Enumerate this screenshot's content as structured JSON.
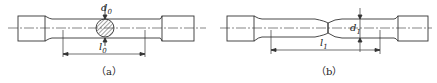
{
  "figures": [
    {
      "id": "a",
      "caption": "（a）",
      "diameter_label": "d",
      "diameter_sub": "0",
      "length_label": "l",
      "length_sub": "0"
    },
    {
      "id": "b",
      "caption": "（b）",
      "diameter_label": "d",
      "diameter_sub": "1",
      "length_label": "l",
      "length_sub": "1"
    }
  ],
  "colors": {
    "line": "#333333",
    "hatch": "#444444",
    "background": "#ffffff"
  }
}
